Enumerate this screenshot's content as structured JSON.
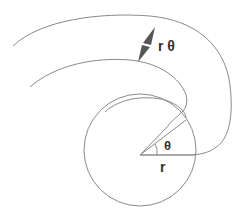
{
  "diagram": {
    "labels": {
      "arc_length": "r θ",
      "angle": "θ",
      "radius": "r"
    },
    "colors": {
      "stroke": "#8a8a8a",
      "arrow": "#555555",
      "text": "#333333"
    }
  }
}
